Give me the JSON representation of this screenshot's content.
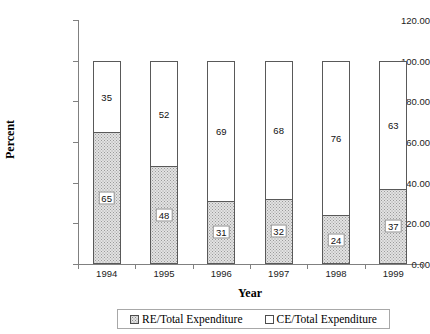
{
  "chart_data": {
    "type": "bar",
    "subtype": "stacked-bar-100",
    "title": "",
    "xlabel": "Year",
    "ylabel": "Percent",
    "categories": [
      "1994",
      "1995",
      "1996",
      "1997",
      "1998",
      "1999"
    ],
    "series": [
      {
        "name": "RE/Total Expenditure",
        "values": [
          65,
          48,
          31,
          32,
          24,
          37
        ],
        "fill": "gray-dotted",
        "label_style": "boxed",
        "color": "#e2e2e2"
      },
      {
        "name": "CE/Total Expenditure",
        "values": [
          35,
          52,
          69,
          68,
          76,
          63
        ],
        "fill": "white",
        "label_style": "plain",
        "color": "#ffffff"
      }
    ],
    "ylim": [
      0,
      120
    ],
    "ytick_step": 20,
    "ytick_labels": [
      "0.00",
      "20.00",
      "40.00",
      "60.00",
      "80.00",
      "100.00",
      "120.00"
    ],
    "ytick_values": [
      0,
      20,
      40,
      60,
      80,
      100,
      120
    ],
    "grid": false,
    "legend_position": "bottom",
    "axis_color": "#808080",
    "bar_border_color": "#595959"
  },
  "axes": {
    "y_title": "Percent",
    "x_title": "Year"
  },
  "legend": {
    "items": [
      {
        "label": "RE/Total Expenditure"
      },
      {
        "label": "CE/Total Expenditure"
      }
    ]
  }
}
